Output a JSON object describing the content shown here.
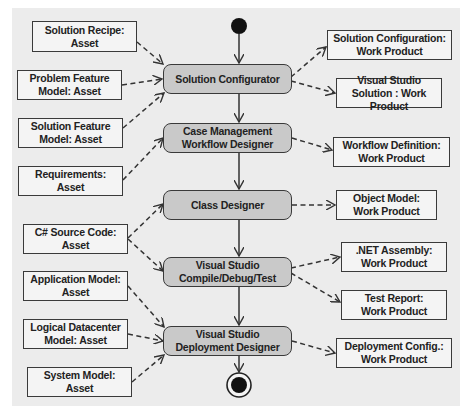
{
  "diagram": {
    "type": "uml-activity",
    "colors": {
      "background": "#ececec",
      "activity_fill": "#c9c9c9",
      "artifact_fill": "#f4f4f4",
      "stroke": "#3a3a3a"
    },
    "start_node": {
      "label": "initial-node"
    },
    "end_node": {
      "label": "final-node"
    },
    "activities": [
      {
        "id": "solution-configurator",
        "lines": [
          "Solution Configurator"
        ]
      },
      {
        "id": "case-management-workflow-designer",
        "lines": [
          "Case Management",
          "Workflow Designer"
        ]
      },
      {
        "id": "class-designer",
        "lines": [
          "Class Designer"
        ]
      },
      {
        "id": "vs-compile-debug-test",
        "lines": [
          "Visual Studio",
          "Compile/Debug/Test"
        ]
      },
      {
        "id": "vs-deployment-designer",
        "lines": [
          "Visual Studio",
          "Deployment Designer"
        ]
      }
    ],
    "inputs": [
      {
        "id": "solution-recipe",
        "lines": [
          "Solution Recipe:",
          "Asset"
        ],
        "to": "solution-configurator"
      },
      {
        "id": "problem-feature-model",
        "lines": [
          "Problem Feature",
          "Model: Asset"
        ],
        "to": "solution-configurator"
      },
      {
        "id": "solution-feature-model",
        "lines": [
          "Solution Feature",
          "Model: Asset"
        ],
        "to": "solution-configurator"
      },
      {
        "id": "requirements",
        "lines": [
          "Requirements:",
          "Asset"
        ],
        "to": "case-management-workflow-designer"
      },
      {
        "id": "csharp-source-code",
        "lines": [
          "C# Source Code:",
          "Asset"
        ],
        "to": [
          "class-designer",
          "vs-compile-debug-test"
        ]
      },
      {
        "id": "application-model",
        "lines": [
          "Application Model:",
          "Asset"
        ],
        "to": "vs-deployment-designer"
      },
      {
        "id": "logical-datacenter-model",
        "lines": [
          "Logical Datacenter",
          "Model: Asset"
        ],
        "to": "vs-deployment-designer"
      },
      {
        "id": "system-model",
        "lines": [
          "System Model:",
          "Asset"
        ],
        "to": "vs-deployment-designer"
      }
    ],
    "outputs": [
      {
        "id": "solution-configuration",
        "lines": [
          "Solution Configuration:",
          "Work Product"
        ],
        "from": "solution-configurator"
      },
      {
        "id": "visual-studio-solution",
        "lines": [
          "Visual Studio",
          "Solution : Work Product"
        ],
        "from": "solution-configurator"
      },
      {
        "id": "workflow-definition",
        "lines": [
          "Workflow Definition:",
          "Work Product"
        ],
        "from": "case-management-workflow-designer"
      },
      {
        "id": "object-model",
        "lines": [
          "Object Model:",
          "Work Product"
        ],
        "from": "class-designer"
      },
      {
        "id": "net-assembly",
        "lines": [
          ".NET Assembly:",
          "Work Product"
        ],
        "from": "vs-compile-debug-test"
      },
      {
        "id": "test-report",
        "lines": [
          "Test Report:",
          "Work Product"
        ],
        "from": "vs-compile-debug-test"
      },
      {
        "id": "deployment-config",
        "lines": [
          "Deployment Config.:",
          "Work Product"
        ],
        "from": "vs-deployment-designer"
      }
    ]
  }
}
